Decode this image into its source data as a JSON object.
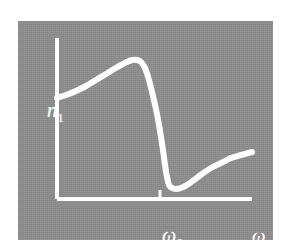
{
  "figure": {
    "kind": "anomalous-dispersion-plot",
    "background_color": "#ffffff",
    "panel_color": "#8e8e8e",
    "ink_color": "#ffffff"
  },
  "labels": {
    "y_axis": "n",
    "y_axis_subscript": "1",
    "x_axis_resonance": "ω",
    "x_axis_resonance_subscript": "0",
    "x_axis": "ω"
  },
  "chart_data": {
    "type": "line",
    "title": "",
    "xlabel": "ω",
    "ylabel": "n₁",
    "grid": false,
    "legend": null,
    "annotations": [
      {
        "text": "ω₀",
        "x": 0.53,
        "note": "resonance frequency tick on x-axis"
      }
    ],
    "axes": {
      "x_start_px": 57,
      "x_end_px": 252,
      "y_top_px": 38,
      "y_baseline_px": 199,
      "tick_x_px": 160,
      "tick_height_px": 9
    },
    "xlim": [
      0,
      1
    ],
    "ylim": [
      0,
      1
    ],
    "series": [
      {
        "name": "refractive index n₁(ω)",
        "description": "normal dispersion rise, sharp anomalous-dispersion drop at ω₀, then recovery",
        "points_px": [
          [
            57,
            98
          ],
          [
            66,
            95
          ],
          [
            76,
            91
          ],
          [
            86,
            86
          ],
          [
            96,
            80
          ],
          [
            106,
            74
          ],
          [
            114,
            69
          ],
          [
            121,
            65
          ],
          [
            127,
            62
          ],
          [
            132,
            60
          ],
          [
            137,
            60
          ],
          [
            141,
            62
          ],
          [
            145,
            68
          ],
          [
            149,
            80
          ],
          [
            153,
            96
          ],
          [
            157,
            114
          ],
          [
            160,
            131
          ],
          [
            163,
            150
          ],
          [
            165,
            165
          ],
          [
            167,
            177
          ],
          [
            169,
            185
          ],
          [
            172,
            188
          ],
          [
            176,
            189
          ],
          [
            181,
            188
          ],
          [
            187,
            185
          ],
          [
            194,
            180
          ],
          [
            202,
            174
          ],
          [
            211,
            168
          ],
          [
            221,
            163
          ],
          [
            231,
            158
          ],
          [
            241,
            155
          ],
          [
            252,
            152
          ]
        ]
      }
    ]
  }
}
